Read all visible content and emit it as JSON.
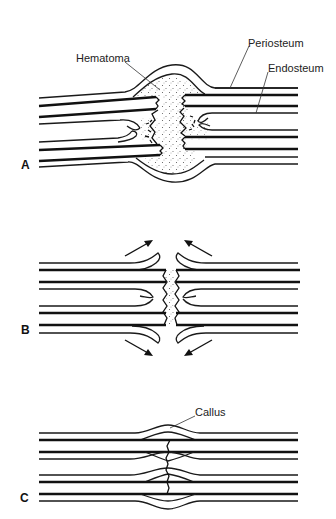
{
  "figure": {
    "panels": [
      {
        "id": "A",
        "label": "A",
        "labels": {
          "hematoma": "Hematoma",
          "periosteum": "Periosteum",
          "endosteum": "Endosteum"
        }
      },
      {
        "id": "B",
        "label": "B"
      },
      {
        "id": "C",
        "label": "C",
        "labels": {
          "callus": "Callus"
        }
      }
    ]
  }
}
